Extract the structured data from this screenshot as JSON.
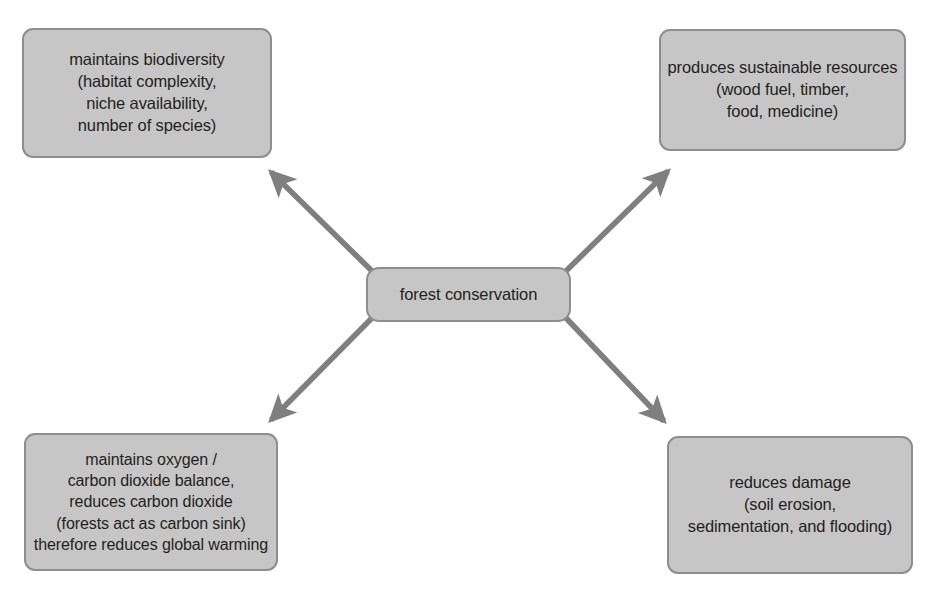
{
  "diagram": {
    "type": "concept-map-radial",
    "colors": {
      "node_fill": "#c6c6c6",
      "node_border": "#8e8e8e",
      "arrow": "#7f7f7f",
      "text": "#231f20",
      "background": "#ffffff"
    },
    "center": {
      "id": "forest-conservation",
      "label": "forest conservation"
    },
    "nodes": [
      {
        "id": "biodiversity",
        "position": "top-left",
        "label": "maintains biodiversity\n(habitat complexity,\nniche availability,\nnumber of species)"
      },
      {
        "id": "resources",
        "position": "top-right",
        "label": "produces sustainable resources\n(wood fuel, timber,\nfood, medicine)"
      },
      {
        "id": "oxygen-carbon-balance",
        "position": "bottom-left",
        "label": "maintains oxygen /\ncarbon dioxide balance,\nreduces carbon dioxide\n(forests act as carbon sink)\ntherefore reduces global warming"
      },
      {
        "id": "reduces-damage",
        "position": "bottom-right",
        "label": "reduces damage\n(soil erosion,\nsedimentation, and flooding)"
      }
    ],
    "arrows": [
      {
        "id": "arrow-to-biodiversity",
        "from": "forest-conservation",
        "to": "biodiversity",
        "direction": "up-left"
      },
      {
        "id": "arrow-to-resources",
        "from": "forest-conservation",
        "to": "resources",
        "direction": "up-right"
      },
      {
        "id": "arrow-to-oxygen",
        "from": "forest-conservation",
        "to": "oxygen-carbon-balance",
        "direction": "down-left"
      },
      {
        "id": "arrow-to-damage",
        "from": "forest-conservation",
        "to": "reduces-damage",
        "direction": "down-right"
      }
    ]
  }
}
